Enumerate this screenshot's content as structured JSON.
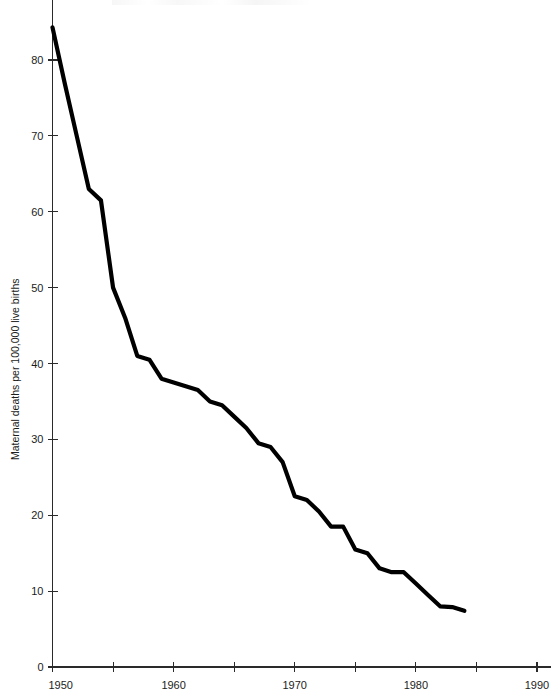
{
  "figure": {
    "background_color": "#ffffff",
    "line_color": "#000000",
    "axis_color": "#2a2a2a",
    "title": ""
  },
  "chart_data": {
    "type": "line",
    "title": "",
    "subtitle": "",
    "xlabel": "",
    "ylabel": "Maternal deaths per 100,000 live births",
    "xlim": [
      1950,
      1990
    ],
    "ylim": [
      0,
      84
    ],
    "grid": false,
    "legend": false,
    "x_ticks_major": [
      1950,
      1960,
      1970,
      1980,
      1990
    ],
    "x_tick_labels": [
      "1950",
      "1960",
      "1970",
      "1980",
      "1990"
    ],
    "x_ticks_minor": [
      1955,
      1965,
      1975,
      1985
    ],
    "y_ticks": [
      0,
      10,
      20,
      30,
      40,
      50,
      60,
      70,
      80
    ],
    "y_tick_labels": [
      "0",
      "10",
      "20",
      "30",
      "40",
      "50",
      "60",
      "70",
      "80"
    ],
    "series": [
      {
        "name": "Maternal deaths per 100,000 live births",
        "color": "#000000",
        "x": [
          1950,
          1951,
          1952,
          1953,
          1954,
          1955,
          1956,
          1957,
          1958,
          1959,
          1960,
          1961,
          1962,
          1963,
          1964,
          1965,
          1966,
          1967,
          1968,
          1969,
          1970,
          1971,
          1972,
          1973,
          1974,
          1975,
          1976,
          1977,
          1978,
          1979,
          1980,
          1981,
          1982,
          1983,
          1984
        ],
        "values": [
          84.3,
          77.0,
          70.0,
          63.0,
          61.5,
          50.0,
          46.0,
          41.0,
          40.5,
          38.0,
          37.5,
          37.0,
          36.5,
          35.0,
          34.5,
          33.0,
          31.5,
          29.5,
          29.0,
          27.0,
          22.5,
          22.0,
          20.5,
          18.5,
          18.5,
          15.5,
          15.0,
          13.0,
          12.5,
          12.5,
          11.0,
          9.5,
          8.0,
          7.9,
          7.4
        ]
      }
    ]
  },
  "axes": {
    "y_axis_title": "Maternal deaths per 100,000 live births"
  }
}
